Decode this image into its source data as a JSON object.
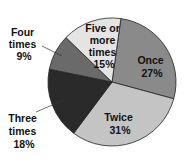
{
  "chart_data": {
    "type": "pie",
    "title": "",
    "slices": [
      {
        "label": "Once",
        "value": 27,
        "color": "#8a8a8a"
      },
      {
        "label": "Twice",
        "value": 31,
        "color": "#c4c4c4"
      },
      {
        "label": "Three times",
        "value": 18,
        "color": "#2a2a2a"
      },
      {
        "label": "Four times",
        "value": 9,
        "color": "#6a6a6a"
      },
      {
        "label": "Five or more times",
        "value": 15,
        "color": "#e4e4e4"
      }
    ],
    "unit": "%"
  },
  "labels": {
    "once": [
      "Once",
      "27%"
    ],
    "twice": [
      "Twice",
      "31%"
    ],
    "three": [
      "Three",
      "times",
      "18%"
    ],
    "four": [
      "Four",
      "times",
      "9%"
    ],
    "five": [
      "Five or",
      "more",
      "times",
      "15%"
    ]
  }
}
